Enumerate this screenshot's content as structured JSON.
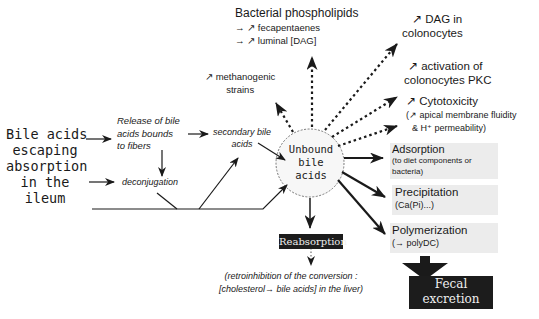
{
  "diagram": {
    "source": {
      "lines": [
        "Bile acids",
        "escaping",
        "absorption",
        "in the",
        "ileum"
      ]
    },
    "release": {
      "lines": [
        "Release of bile",
        "acids bounds",
        "to fibers"
      ]
    },
    "deconjugation": "deconjugation",
    "secondary": {
      "lines": [
        "secondary bile",
        "acids"
      ]
    },
    "center": {
      "lines": [
        "Unbound",
        "bile",
        "acids"
      ]
    },
    "top": {
      "bacterial": {
        "title": "Bacterial phospholipids",
        "items": [
          "→ ↗ fecapentaenes",
          "→ ↗ luminal [DAG]"
        ]
      },
      "methanogenic": {
        "lines": [
          "↗ methanogenic",
          "strains"
        ]
      }
    },
    "right_effects": [
      {
        "lines": [
          "↗ DAG in",
          "colonocytes"
        ]
      },
      {
        "lines": [
          "↗ activation of",
          "colonocytes PKC"
        ]
      },
      {
        "lines": [
          "↗ Cytotoxicity",
          "(↗ apical membrane fluidity",
          "& H⁺ permeability)"
        ]
      }
    ],
    "fates": [
      {
        "title": "Adsorption",
        "sub": [
          "(to diet components or",
          "bacteria)"
        ]
      },
      {
        "title": "Precipitation",
        "sub": [
          "(Ca(Pi)...)"
        ]
      },
      {
        "title": "Polymerization",
        "sub": [
          "(→ polyDC)"
        ]
      }
    ],
    "reabsorption": {
      "label": "Reabsorption",
      "note": [
        "(retroinhibition of the conversion :",
        "[cholesterol→  bile acids] in the liver)"
      ]
    },
    "excretion": {
      "lines": [
        "Fecal",
        "excretion"
      ]
    }
  },
  "colors": {
    "ink": "#1a1a1a",
    "dark_box": "#1c1c1c",
    "shade": "#ececec"
  }
}
